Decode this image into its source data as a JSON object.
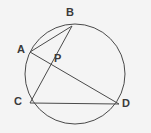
{
  "figure": {
    "kind": "circle-geometry-diagram",
    "background_color": "#f4f4f4",
    "stroke_color": "#4a4a4a",
    "label_color": "#3a3a3a",
    "canvas": {
      "width": 151,
      "height": 133
    },
    "circle": {
      "cx": 75,
      "cy": 74,
      "r": 50
    },
    "points": [
      {
        "id": "A",
        "label": "A",
        "x": 30,
        "y": 52,
        "label_x": 17,
        "label_y": 44,
        "on_circle": true
      },
      {
        "id": "B",
        "label": "B",
        "x": 72,
        "y": 26,
        "label_x": 66,
        "label_y": 7,
        "on_circle": true
      },
      {
        "id": "C",
        "label": "C",
        "x": 30,
        "y": 103,
        "label_x": 14,
        "label_y": 96,
        "on_circle": true
      },
      {
        "id": "D",
        "label": "D",
        "x": 119,
        "y": 104,
        "label_x": 122,
        "label_y": 98,
        "on_circle": true
      },
      {
        "id": "P",
        "label": "P",
        "x": 51,
        "y": 59,
        "label_x": 54,
        "label_y": 53,
        "on_circle": false
      }
    ],
    "segments": [
      {
        "id": "AB",
        "from": "A",
        "to": "B",
        "x1": 30,
        "y1": 52,
        "x2": 72,
        "y2": 26
      },
      {
        "id": "AD",
        "from": "A",
        "to": "D",
        "x1": 30,
        "y1": 52,
        "x2": 119,
        "y2": 104
      },
      {
        "id": "BC",
        "from": "B",
        "to": "C",
        "x1": 72,
        "y1": 26,
        "x2": 30,
        "y2": 103
      },
      {
        "id": "CD",
        "from": "C",
        "to": "D",
        "x1": 30,
        "y1": 103,
        "x2": 119,
        "y2": 104
      }
    ]
  }
}
